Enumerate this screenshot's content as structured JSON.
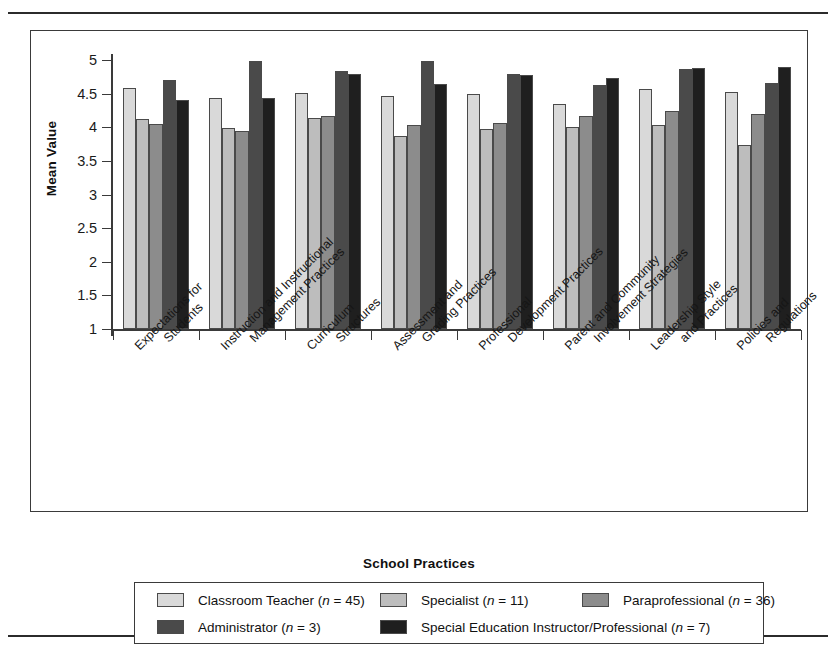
{
  "chart_data": {
    "type": "bar",
    "title": "",
    "xlabel": "School Practices",
    "ylabel": "Mean Value",
    "ylim": [
      1,
      5
    ],
    "yticks": [
      "1",
      "1.5",
      "2",
      "2.5",
      "3",
      "3.5",
      "4",
      "4.5",
      "5"
    ],
    "grid": false,
    "legend_position": "bottom",
    "categories": [
      "Expectations for Students",
      "Instruction and Instructional Management Practices",
      "Curriculum Structures",
      "Assessment and Grading Practices",
      "Professional Development Practices",
      "Parent and Community Involvement Strategies",
      "Leadership Style and Practices",
      "Policies and Regulations"
    ],
    "category_lines": [
      [
        "Expectations for",
        "Students"
      ],
      [
        "Instruction and Instructional",
        "Management Practices"
      ],
      [
        "Curriculum",
        "Structures"
      ],
      [
        "Assessment and",
        "Grading Practices"
      ],
      [
        "Professional",
        "Development Practices"
      ],
      [
        "Parent and Community",
        "Involvement Strategies"
      ],
      [
        "Leadership Style",
        "and Practices"
      ],
      [
        "Policies and",
        "Regulations"
      ]
    ],
    "series": [
      {
        "name": "Classroom Teacher",
        "n": 45,
        "legend_label": "Classroom Teacher (n = 45)",
        "color": "#d9d9d9",
        "values": [
          4.58,
          4.43,
          4.51,
          4.46,
          4.5,
          4.34,
          4.57,
          4.53
        ]
      },
      {
        "name": "Specialist",
        "n": 11,
        "legend_label": "Specialist (n = 11)",
        "color": "#bdbdbd",
        "values": [
          4.12,
          3.99,
          4.14,
          3.87,
          3.97,
          4.01,
          4.03,
          3.73
        ]
      },
      {
        "name": "Paraprofessional",
        "n": 36,
        "legend_label": "Paraprofessional (n = 36)",
        "color": "#8c8c8c",
        "values": [
          4.05,
          3.95,
          4.17,
          4.04,
          4.06,
          4.17,
          4.24,
          4.2
        ]
      },
      {
        "name": "Administrator",
        "n": 3,
        "legend_label": "Administrator (n = 3)",
        "color": "#4a4a4a",
        "values": [
          4.7,
          4.99,
          4.83,
          4.98,
          4.79,
          4.63,
          4.86,
          4.66
        ]
      },
      {
        "name": "Special Education Instructor/Professional",
        "n": 7,
        "legend_label": "Special Education Instructor/Professional (n = 7)",
        "color": "#1f1f1f",
        "values": [
          4.4,
          4.44,
          4.79,
          4.64,
          4.77,
          4.74,
          4.88,
          4.9
        ]
      }
    ]
  },
  "axis": {
    "y_title": "Mean Value",
    "x_title": "School Practices"
  },
  "legend": {
    "rows": [
      [
        "Classroom Teacher (n = 45)",
        "Specialist (n = 11)",
        "Paraprofessional (n = 36)"
      ],
      [
        "Administrator (n = 3)",
        "Special Education Instructor/Professional (n = 7)"
      ]
    ]
  }
}
